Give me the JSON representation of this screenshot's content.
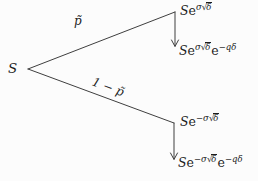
{
  "figure": {
    "title_hidden": "",
    "root_label": "S",
    "prob_up": "p̃",
    "prob_down": "1 − p̃",
    "sqrt_sign": "√",
    "node_up": {
      "s": "S",
      "e": "e",
      "coeff": "σ",
      "root_arg": "δ"
    },
    "node_up_div": {
      "s": "S",
      "e": "e",
      "coeff": "σ",
      "root_arg": "δ",
      "e2": "e",
      "exp2": "−qδ"
    },
    "node_down": {
      "s": "S",
      "e": "e",
      "coeff": "−σ",
      "root_arg": "δ"
    },
    "node_down_div": {
      "s": "S",
      "e": "e",
      "coeff": "−σ",
      "root_arg": "δ",
      "e2": "e",
      "exp2": "−qδ"
    }
  },
  "colors": {
    "ink": "#1c1c1c",
    "line": "#3f3f3f",
    "background": "#fcfcfc"
  }
}
